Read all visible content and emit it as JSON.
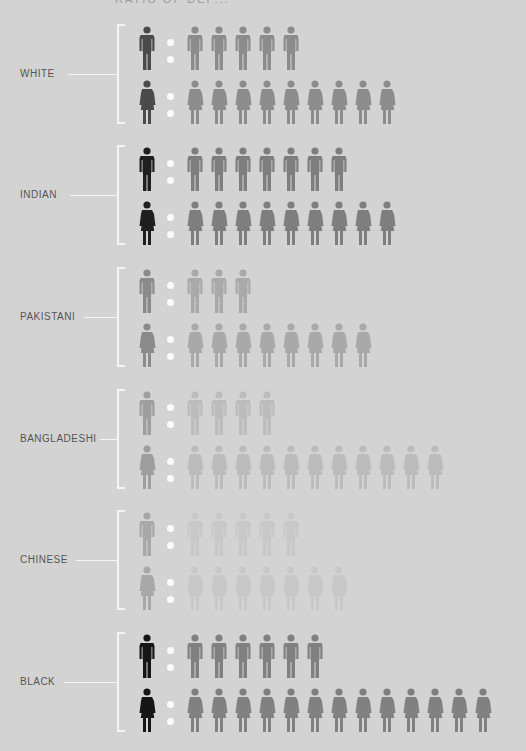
{
  "title": "RATIO OF DEP...",
  "colors": {
    "background": "#d3d3d3",
    "bracket": "#f5f5f5",
    "dot": "#fafafa",
    "label": "#555555"
  },
  "chart_data": {
    "type": "pictogram",
    "title": "",
    "categories": [
      "WHITE",
      "INDIAN",
      "PAKISTANI",
      "BANGLADESHI",
      "CHINESE",
      "BLACK"
    ],
    "series": [
      {
        "name": "men",
        "values": [
          5,
          7,
          3,
          4,
          5,
          6
        ]
      },
      {
        "name": "women",
        "values": [
          9,
          9,
          8,
          11,
          7,
          13
        ]
      }
    ]
  },
  "groups": [
    {
      "label": "WHITE",
      "top": 24,
      "main": "#4a4a4a",
      "other": "#8c8c8c",
      "men": 5,
      "women": 9,
      "labelWidth": 40
    },
    {
      "label": "INDIAN",
      "top": 145,
      "main": "#1f1f1f",
      "other": "#7e7e7e",
      "men": 7,
      "women": 9,
      "labelWidth": 42
    },
    {
      "label": "PAKISTANI",
      "top": 267,
      "main": "#8a8a8a",
      "other": "#a9a9a9",
      "men": 3,
      "women": 8,
      "labelWidth": 56
    },
    {
      "label": "BANGLADESHI",
      "top": 389,
      "main": "#9e9e9e",
      "other": "#bcbcbc",
      "men": 4,
      "women": 11,
      "labelWidth": 72
    },
    {
      "label": "CHINESE",
      "top": 510,
      "main": "#a8a8a8",
      "other": "#c8c8c8",
      "men": 5,
      "women": 7,
      "labelWidth": 48
    },
    {
      "label": "BLACK",
      "top": 632,
      "main": "#161616",
      "other": "#808080",
      "men": 6,
      "women": 13,
      "labelWidth": 36
    }
  ]
}
